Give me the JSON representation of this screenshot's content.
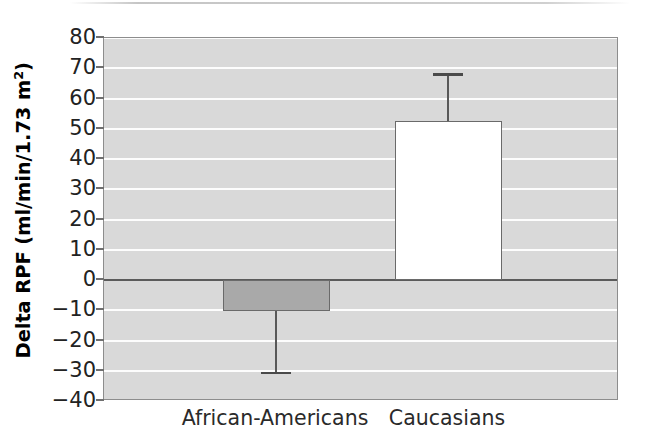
{
  "chart_data": {
    "type": "bar",
    "title": "",
    "xlabel": "",
    "ylabel": "Delta RPF (ml/min/1.73 m²)",
    "ylabel_parts": {
      "main": "Delta RPF (ml/min/1.73 m",
      "superscript": "2",
      "tail": ")"
    },
    "categories": [
      "African-Americans",
      "Caucasians"
    ],
    "values": [
      -10.3,
      52.5
    ],
    "errors_high": [
      -10.3,
      68.0
    ],
    "errors_low": [
      -30.7,
      52.5
    ],
    "error_style": "single-sided-outward",
    "bar_colors": [
      "#a9a9a9",
      "#ffffff"
    ],
    "bar_edge_color": "#6a6a6a",
    "ylim": [
      -40,
      80
    ],
    "ytick_step": 10,
    "yticks": [
      80,
      70,
      60,
      50,
      40,
      30,
      20,
      10,
      0,
      -10,
      -20,
      -30,
      -40
    ],
    "ytick_labels": [
      "80",
      "70",
      "60",
      "50",
      "40",
      "30",
      "20",
      "10",
      "0",
      "−10",
      "−20",
      "−30",
      "−40"
    ],
    "grid": true,
    "gridline_color": "#fdfdfd",
    "plot_background": "#d9d9d9",
    "zero_line": true,
    "zero_line_color": "#5b5b5b",
    "legend": false,
    "legend_position": "none"
  }
}
